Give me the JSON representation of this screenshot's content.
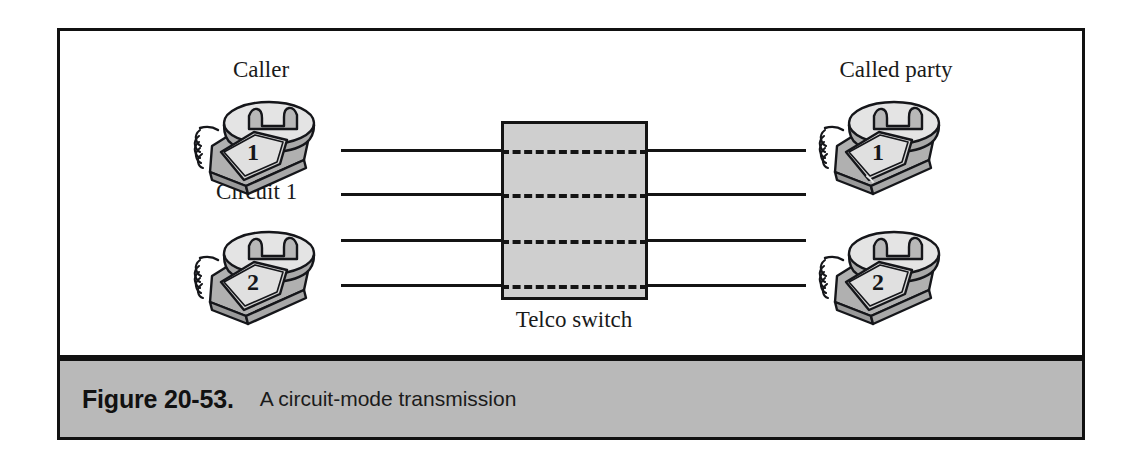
{
  "figure": {
    "caption_number": "Figure 20-53.",
    "caption_text": "A circuit-mode transmission"
  },
  "diagram": {
    "type": "network-diagram",
    "title": "A circuit-mode transmission",
    "left_group_label": "Caller",
    "right_group_label": "Called party",
    "switch_label": "Telco switch",
    "circuit_labels": [
      "Circuit 1",
      "Circuit 2"
    ],
    "left_phones": [
      {
        "name": "caller-phone-1",
        "digit": "1"
      },
      {
        "name": "caller-phone-2",
        "digit": "2"
      }
    ],
    "right_phones": [
      {
        "name": "called-phone-1",
        "digit": "1"
      },
      {
        "name": "called-phone-2",
        "digit": "2"
      }
    ],
    "wire_count_left": 4,
    "wire_count_right": 4,
    "dashed_paths_in_switch": 4,
    "colors": {
      "frame": "#111111",
      "caption_bar": "#b9b9b9",
      "switch_fill": "#cfcfcf",
      "wire": "#141414",
      "phone_body": "#b5b5b5",
      "phone_highlight": "#e3e3e3",
      "page_background": "#ffffff"
    }
  }
}
